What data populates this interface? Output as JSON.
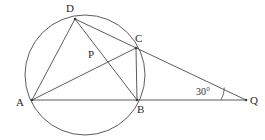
{
  "figure": {
    "background_color": "#ffffff",
    "stroke_color": "#4a4a4a",
    "label_color": "#2b2b2b"
  },
  "circle": {
    "name": "circumscribed-circle",
    "cx": 85,
    "cy": 75,
    "r": 60
  },
  "points": [
    {
      "id": "A",
      "label": "A",
      "x": 32,
      "y": 100,
      "label_x": 16,
      "label_y": 97,
      "on_circle": true
    },
    {
      "id": "B",
      "label": "B",
      "x": 137,
      "y": 100,
      "label_x": 137,
      "label_y": 104,
      "on_circle": true
    },
    {
      "id": "C",
      "label": "C",
      "x": 136,
      "y": 48,
      "label_x": 135,
      "label_y": 33,
      "on_circle": true
    },
    {
      "id": "D",
      "label": "D",
      "x": 75,
      "y": 19,
      "label_x": 66,
      "label_y": 3,
      "on_circle": true
    },
    {
      "id": "P",
      "label": "P",
      "x": 107,
      "y": 60,
      "label_x": 88,
      "label_y": 49,
      "on_circle": false
    },
    {
      "id": "Q",
      "label": "Q",
      "x": 246,
      "y": 100,
      "label_x": 250,
      "label_y": 95,
      "on_circle": false
    }
  ],
  "segments": [
    {
      "name": "segment-DA",
      "from": "D",
      "to": "A"
    },
    {
      "name": "segment-DB",
      "from": "D",
      "to": "B"
    },
    {
      "name": "segment-DQ",
      "from": "D",
      "to": "Q"
    },
    {
      "name": "segment-AC",
      "from": "A",
      "to": "C"
    },
    {
      "name": "segment-AQ",
      "from": "A",
      "to": "Q"
    },
    {
      "name": "segment-CB",
      "from": "C",
      "to": "B"
    }
  ],
  "angle_marks": [
    {
      "name": "angle-Q",
      "label": "30°",
      "vertex": "Q",
      "label_x": 196,
      "label_y": 87,
      "arc_radius": 25
    }
  ]
}
